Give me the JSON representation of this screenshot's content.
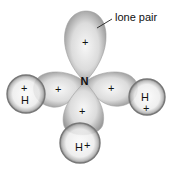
{
  "diagram": {
    "central_atom": "N",
    "lone_pair_label": "lone pair",
    "lobe_charge": "+",
    "hydrogen_label": "H",
    "hydrogen_charge": "+",
    "lobes": [
      {
        "id": "top",
        "role": "lone pair",
        "charge": "+"
      },
      {
        "id": "left",
        "role": "bond to H",
        "charge": "+"
      },
      {
        "id": "right",
        "role": "bond to H",
        "charge": "+"
      },
      {
        "id": "bottom",
        "role": "bond to H",
        "charge": "+"
      }
    ],
    "hydrogens": [
      {
        "id": "left",
        "label": "H",
        "charge": "+"
      },
      {
        "id": "right",
        "label": "H",
        "charge": "+"
      },
      {
        "id": "bottom",
        "label": "H",
        "charge": "+"
      }
    ],
    "colors": {
      "lobe_edge": "#8a8a8a",
      "lobe_center": "#f4f4f4",
      "sphere_edge": "#7a7a7a",
      "text": "#111111"
    }
  }
}
